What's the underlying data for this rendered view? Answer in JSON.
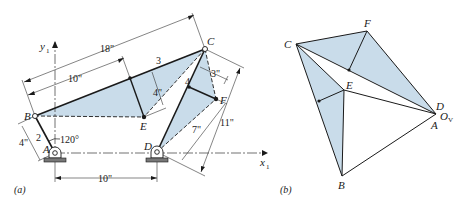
{
  "figure_a": {
    "caption": "(a)",
    "axes": {
      "y_label": "y",
      "y_sub": "1",
      "x_label": "x",
      "x_sub": "1"
    },
    "points": {
      "A": "A",
      "B": "B",
      "C": "C",
      "D": "D",
      "E": "E",
      "F": "F"
    },
    "links": {
      "link2": "2",
      "link3": "3",
      "link4": "4"
    },
    "dimensions": {
      "BC": "18\"",
      "B_to_mid": "10\"",
      "mid_to_E": "4\"",
      "AB": "4\"",
      "angle": "120°",
      "AD": "10\"",
      "C_to_F_offset": "3\"",
      "D_to_F": "7\"",
      "D_to_C": "11\""
    }
  },
  "figure_b": {
    "caption": "(b)",
    "points": {
      "C": "C",
      "F": "F",
      "E": "E",
      "D": "D",
      "O": "O",
      "O_sub": "V",
      "A": "A",
      "B": "B"
    }
  },
  "colors": {
    "fill": "#c9dcea",
    "line": "#1a1a1a"
  }
}
